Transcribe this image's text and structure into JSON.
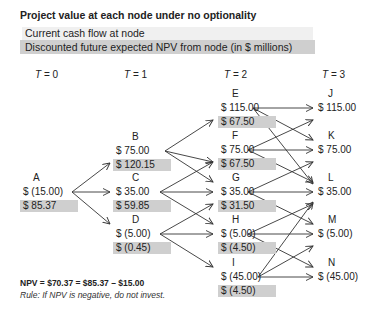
{
  "title": "Project value at each node under no optionality",
  "legend": {
    "cash_flow_label": "Current cash flow at node",
    "npv_label": "Discounted future expected NPV from node (in $ millions)",
    "cash_flow_bg": "#f0f0f0",
    "npv_bg": "#cfcfcf"
  },
  "time_labels": [
    {
      "var": "T",
      "eq": " = 0"
    },
    {
      "var": "T",
      "eq": " = 1"
    },
    {
      "var": "T",
      "eq": " = 2"
    },
    {
      "var": "T",
      "eq": " = 3"
    }
  ],
  "nodes": {
    "A": {
      "name": "A",
      "cash_flow": "$ (15.00)",
      "npv": "$ 85.37"
    },
    "B": {
      "name": "B",
      "cash_flow": "$ 75.00",
      "npv": "$ 120.15"
    },
    "C": {
      "name": "C",
      "cash_flow": "$ 35.00",
      "npv": "$ 59.85"
    },
    "D": {
      "name": "D",
      "cash_flow": "$ (5.00)",
      "npv": "$ (0.45)"
    },
    "E": {
      "name": "E",
      "cash_flow": "$ 115.00",
      "npv": "$ 67.50"
    },
    "F": {
      "name": "F",
      "cash_flow": "$ 75.00",
      "npv": "$ 67.50"
    },
    "G": {
      "name": "G",
      "cash_flow": "$ 35.00",
      "npv": "$ 31.50"
    },
    "H": {
      "name": "H",
      "cash_flow": "$ (5.00)",
      "npv": "$ (4.50)"
    },
    "I": {
      "name": "I",
      "cash_flow": "$ (45.00)",
      "npv": "$ (4.50)"
    },
    "J": {
      "name": "J",
      "cash_flow": "$ 115.00"
    },
    "K": {
      "name": "K",
      "cash_flow": "$ 75.00"
    },
    "L": {
      "name": "L",
      "cash_flow": "$ 35.00"
    },
    "M": {
      "name": "M",
      "cash_flow": "$ (5.00)"
    },
    "N": {
      "name": "N",
      "cash_flow": "$ (45.00)"
    }
  },
  "edges": [
    [
      "A",
      "B"
    ],
    [
      "A",
      "C"
    ],
    [
      "A",
      "D"
    ],
    [
      "B",
      "E"
    ],
    [
      "B",
      "F"
    ],
    [
      "B",
      "G"
    ],
    [
      "C",
      "F"
    ],
    [
      "C",
      "G"
    ],
    [
      "C",
      "H"
    ],
    [
      "D",
      "G"
    ],
    [
      "D",
      "H"
    ],
    [
      "D",
      "I"
    ],
    [
      "E",
      "J"
    ],
    [
      "E",
      "K"
    ],
    [
      "E",
      "L"
    ],
    [
      "F",
      "J"
    ],
    [
      "F",
      "K"
    ],
    [
      "F",
      "L"
    ],
    [
      "G",
      "K"
    ],
    [
      "G",
      "L"
    ],
    [
      "G",
      "M"
    ],
    [
      "H",
      "L"
    ],
    [
      "H",
      "M"
    ],
    [
      "H",
      "N"
    ],
    [
      "I",
      "L"
    ],
    [
      "I",
      "M"
    ],
    [
      "I",
      "N"
    ]
  ],
  "footer": {
    "formula": "NPV = $70.37 = $85.37 – $15.00",
    "rule": "Rule: If NPV is negative, do not invest."
  }
}
